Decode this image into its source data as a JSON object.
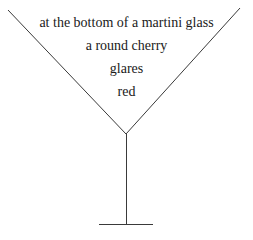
{
  "canvas": {
    "width": 253,
    "height": 240,
    "background_color": "#ffffff"
  },
  "poem": {
    "title": "at the bottom of a martini glass",
    "lines": [
      {
        "text": "at the bottom of a martini glass"
      },
      {
        "text": "a round cherry"
      },
      {
        "text": "glares"
      },
      {
        "text": "red"
      }
    ],
    "text_color": "#1a1a1a"
  },
  "drawing": {
    "name": "martini-glass",
    "stroke_color": "#3a3a3a",
    "stroke_width": 1,
    "parts": {
      "bowl_left_edge": {
        "x1": 8,
        "y1": 10,
        "x2": 126,
        "y2": 134
      },
      "bowl_right_edge": {
        "x1": 126,
        "y1": 134,
        "x2": 240,
        "y2": 8
      },
      "stem": {
        "x1": 126,
        "y1": 134,
        "x2": 126,
        "y2": 224
      },
      "base": {
        "x1": 99,
        "y1": 224,
        "x2": 153,
        "y2": 224
      }
    }
  }
}
